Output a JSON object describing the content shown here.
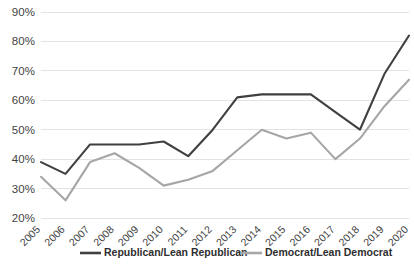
{
  "chart_data": {
    "type": "line",
    "title": "",
    "subtitle": "",
    "xlabel": "",
    "ylabel": "",
    "grid": "horizontal",
    "legend_position": "bottom",
    "categories": [
      "2005",
      "2006",
      "2007",
      "2008",
      "2009",
      "2010",
      "2011",
      "2012",
      "2013",
      "2014",
      "2015",
      "2016",
      "2017",
      "2018",
      "2019",
      "2020"
    ],
    "x": [
      2005,
      2006,
      2007,
      2008,
      2009,
      2010,
      2011,
      2012,
      2013,
      2014,
      2015,
      2016,
      2017,
      2018,
      2019,
      2020
    ],
    "ylim": [
      20,
      90
    ],
    "yticks": [
      20,
      30,
      40,
      50,
      60,
      70,
      80,
      90
    ],
    "ytick_labels": [
      "20%",
      "30%",
      "40%",
      "50%",
      "60%",
      "70%",
      "80%",
      "90%"
    ],
    "series": [
      {
        "name": "Republican/Lean Republican",
        "color": "#404040",
        "values": [
          39,
          35,
          45,
          45,
          45,
          46,
          41,
          50,
          61,
          62,
          62,
          62,
          56,
          50,
          69,
          82
        ]
      },
      {
        "name": "Democrat/Lean Democrat",
        "color": "#a6a6a6",
        "values": [
          34,
          26,
          39,
          42,
          37,
          31,
          33,
          36,
          43,
          50,
          47,
          49,
          40,
          47,
          58,
          67
        ]
      }
    ]
  },
  "legend": {
    "items": [
      {
        "label": "Republican/Lean Republican",
        "color": "#404040"
      },
      {
        "label": "Democrat/Lean Democrat",
        "color": "#a6a6a6"
      }
    ]
  },
  "axes": {
    "y": {
      "ticks": [
        "90%",
        "80%",
        "70%",
        "60%",
        "50%",
        "40%",
        "30%",
        "20%"
      ]
    },
    "x": {
      "ticks": [
        "2005",
        "2006",
        "2007",
        "2008",
        "2009",
        "2010",
        "2011",
        "2012",
        "2013",
        "2014",
        "2015",
        "2016",
        "2017",
        "2018",
        "2019",
        "2020"
      ]
    }
  },
  "style": {
    "gridline_color": "#e3e3e3",
    "background": "#ffffff",
    "line_width": 2.1
  }
}
